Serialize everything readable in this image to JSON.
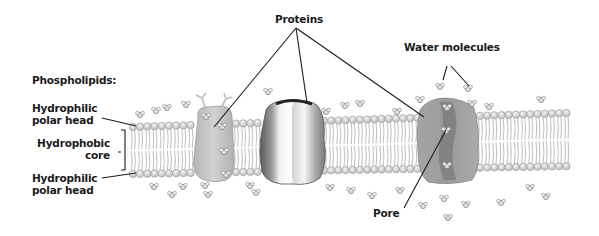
{
  "diagram": {
    "labels": {
      "proteins": "Proteins",
      "water_molecules": "Water molecules",
      "phospholipids": "Phospholipids:",
      "hydrophilic_top_1": "Hydrophilic",
      "hydrophilic_top_2": "polar head",
      "hydrophobic_1": "Hydrophobic",
      "hydrophobic_2": "core",
      "hydrophilic_bottom_1": "Hydrophilic",
      "hydrophilic_bottom_2": "polar head",
      "pore": "Pore"
    },
    "colors": {
      "head_fill": "#d9d9d9",
      "head_stroke": "#9a9a9a",
      "tail": "#bdbdbd",
      "protein_light": "#c8c8c8",
      "protein_dark": "#6e6e6e",
      "channel": "#8c8c8c",
      "leader": "#1a1a1a"
    }
  }
}
